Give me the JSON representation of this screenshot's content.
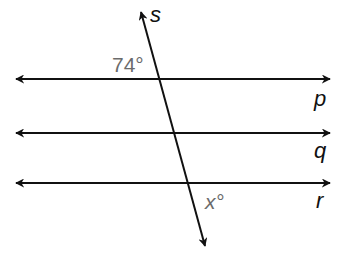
{
  "diagram": {
    "type": "parallel lines cut by a transversal",
    "lines": [
      {
        "name": "p",
        "y": 79
      },
      {
        "name": "q",
        "y": 133
      },
      {
        "name": "r",
        "y": 183
      }
    ],
    "transversal": {
      "name": "s"
    },
    "angles": {
      "given": "74°",
      "unknown": "x°"
    },
    "colors": {
      "line": "#111111",
      "angle_label": "#6b6b6b"
    }
  }
}
